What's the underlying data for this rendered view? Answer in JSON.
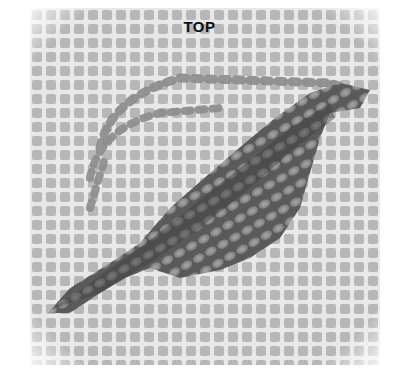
{
  "figure": {
    "label": "TOP",
    "colors": {
      "canvas_hole": "#b9b9b9",
      "canvas_bar": "#e6e6e6",
      "stitch_dark": "#4a4a4a",
      "stitch_mid": "#7a7a7a",
      "stitch_light": "#9d9d9d",
      "outline_stitch": "#8c8c8c"
    }
  }
}
